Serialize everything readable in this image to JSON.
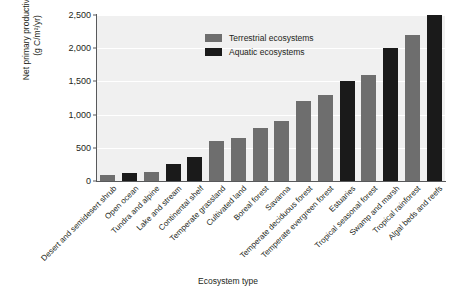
{
  "chart_data": {
    "type": "bar",
    "title": "",
    "xlabel": "Ecosystem type",
    "ylabel": "Net primary productivity (g C/m²/yr)",
    "ylabel_line1": "Net primary productivity",
    "ylabel_line2": "(g C/m²/yr)",
    "ylim": [
      0,
      2500
    ],
    "yticks": [
      0,
      500,
      1000,
      1500,
      2000,
      2500
    ],
    "ytick_labels": [
      "0",
      "500",
      "1,000",
      "1,500",
      "2,000",
      "2,500"
    ],
    "grid": true,
    "legend_position": "top-left",
    "categories": [
      "Desert and semidesert shrub",
      "Open ocean",
      "Tundra and alpine",
      "Lake and stream",
      "Continental shelf",
      "Temperate grassland",
      "Cultivated land",
      "Boreal forest",
      "Savanna",
      "Temperate deciduous forest",
      "Temperate evergreen forest",
      "Estuaries",
      "Tropical seasonal forest",
      "Swamp and marsh",
      "Tropical rainforest",
      "Algal beds and reefs"
    ],
    "values": [
      90,
      125,
      140,
      250,
      360,
      600,
      650,
      800,
      900,
      1200,
      1300,
      1500,
      1600,
      2000,
      2200,
      2500
    ],
    "group": [
      "terrestrial",
      "aquatic",
      "terrestrial",
      "aquatic",
      "aquatic",
      "terrestrial",
      "terrestrial",
      "terrestrial",
      "terrestrial",
      "terrestrial",
      "terrestrial",
      "aquatic",
      "terrestrial",
      "aquatic",
      "terrestrial",
      "aquatic"
    ],
    "series": [
      {
        "name": "Terrestrial ecosystems",
        "color": "#6e6e6e"
      },
      {
        "name": "Aquatic ecosystems",
        "color": "#1a1a1a"
      }
    ]
  },
  "legend": {
    "items": [
      {
        "label": "Terrestrial ecosystems",
        "key": "terrestrial"
      },
      {
        "label": "Aquatic ecosystems",
        "key": "aquatic"
      }
    ]
  },
  "colors": {
    "terrestrial": "#6e6e6e",
    "aquatic": "#1a1a1a",
    "plot_background": "#f0f0f0",
    "gridline": "#ffffff",
    "axis": "#58595b",
    "text": "#231f20",
    "page_background": "#ffffff"
  }
}
